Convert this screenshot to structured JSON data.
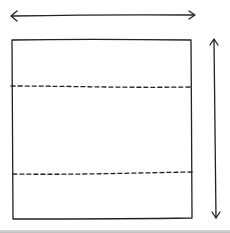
{
  "diagram": {
    "stroke_color": "#222222",
    "sections": 3,
    "dividers": [
      "dashed-line-upper",
      "dashed-line-lower"
    ],
    "arrows": [
      {
        "name": "width-arrow",
        "orientation": "horizontal",
        "double_headed": true
      },
      {
        "name": "height-arrow",
        "orientation": "vertical",
        "double_headed": true
      }
    ]
  }
}
